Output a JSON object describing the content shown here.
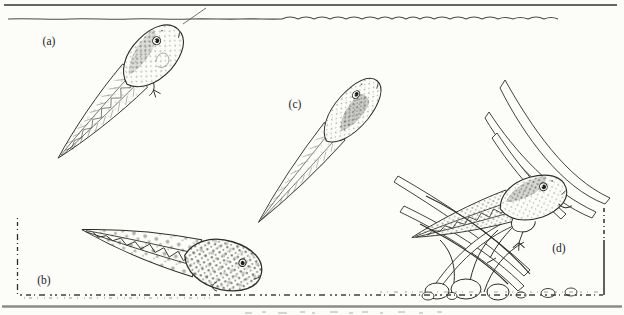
{
  "illustration": {
    "labels": {
      "a": "(a)",
      "b": "(b)",
      "c": "(c)",
      "d": "(d)"
    },
    "elements": {
      "water_surface": "wavy-water-surface-line",
      "top_border": "frame-top-line",
      "substrate": "dotted-sandy-bottom-line",
      "bottom_rule": "gray-bottom-rule",
      "left_margin_tick": "left-dashed-vertical-tick",
      "right_margin_tick": "right-dash-dot-vertical-tick",
      "plants": "curved-pondweed-blades",
      "rocks": "rounded-pebbles",
      "tadpole_a": "tadpole-at-water-surface",
      "tadpole_b": "tadpole-resting-on-bottom",
      "tadpole_c": "tadpole-swimming-midwater",
      "tadpole_d": "metamorphosing-tadpole-with-legs"
    }
  },
  "colors": {
    "ink": "#2e2e29",
    "paper": "#fcfcf8",
    "bottom_rule": "#8b8b87",
    "label_text": "#24241f"
  }
}
